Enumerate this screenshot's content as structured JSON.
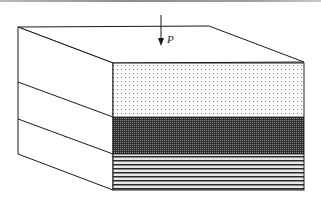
{
  "figure": {
    "type": "layered-block-3d",
    "load": {
      "label": "P",
      "direction": "down"
    },
    "layers": [
      {
        "name": "top-layer",
        "pattern": "sparse-dots",
        "color": "#ffffff",
        "dot_color": "#6a6a6a"
      },
      {
        "name": "middle-layer",
        "pattern": "dense-dots",
        "color": "#3a3a3a",
        "dot_color": "#8a8a8a"
      },
      {
        "name": "bottom-layer",
        "pattern": "horizontal-stripes",
        "color": "#ffffff",
        "stripe_color": "#2a2a2a"
      }
    ],
    "colors": {
      "line": "#1a1a1a",
      "background": "#ffffff"
    }
  }
}
